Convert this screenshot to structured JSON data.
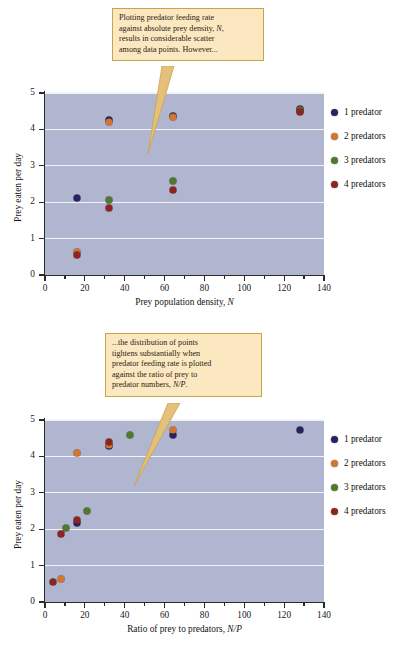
{
  "colors": {
    "plot_background": "#b0b6cf",
    "gridline": "#f2f3f8",
    "callout_fill": "#fbe8c0",
    "callout_border": "#c8a44e",
    "series_1_predator": "#2b2060",
    "series_2_predators": "#d4762a",
    "series_3_predators": "#4f7a2a",
    "series_4_predators": "#8e2420"
  },
  "legend": {
    "items": [
      {
        "label": "1 predator",
        "color": "#2b2060"
      },
      {
        "label": "2 predators",
        "color": "#d4762a"
      },
      {
        "label": "3 predators",
        "color": "#4f7a2a"
      },
      {
        "label": "4 predators",
        "color": "#8e2420"
      }
    ]
  },
  "callouts": {
    "top": {
      "lines": [
        "Plotting predator feeding rate",
        "against absolute prey density, N,",
        "results in considerable scatter",
        "among data points. However..."
      ]
    },
    "bottom": {
      "lines": [
        "...the distribution of points",
        "tightens substantially when",
        "predator feeding rate is plotted",
        "against the ratio of prey to",
        "predator numbers, N/P."
      ]
    }
  },
  "axis_ticks": {
    "y": [
      "0",
      "1",
      "2",
      "3",
      "4",
      "5"
    ],
    "x": [
      "0",
      "20",
      "40",
      "60",
      "80",
      "100",
      "120",
      "140"
    ]
  },
  "chart_data": [
    {
      "id": "top",
      "type": "scatter",
      "title": "",
      "xlabel": "Prey population density, N",
      "ylabel": "Prey eaten per day",
      "xlim": [
        0,
        140
      ],
      "ylim": [
        0,
        5
      ],
      "xticks": [
        0,
        20,
        40,
        60,
        80,
        100,
        120,
        140
      ],
      "yticks": [
        0,
        1,
        2,
        3,
        4,
        5
      ],
      "grid": true,
      "legend_position": "right",
      "series": [
        {
          "name": "1 predator",
          "color": "#2b2060",
          "points": [
            [
              16,
              2.12
            ],
            [
              32,
              4.25
            ],
            [
              64,
              4.37
            ],
            [
              128,
              4.55
            ]
          ]
        },
        {
          "name": "2 predators",
          "color": "#d4762a",
          "points": [
            [
              16,
              0.62
            ],
            [
              32,
              4.21
            ],
            [
              64,
              4.33
            ],
            [
              128,
              4.52
            ]
          ]
        },
        {
          "name": "3 predators",
          "color": "#4f7a2a",
          "points": [
            [
              32,
              2.07
            ],
            [
              64,
              2.57
            ],
            [
              128,
              4.5
            ]
          ]
        },
        {
          "name": "4 predators",
          "color": "#8e2420",
          "points": [
            [
              16,
              0.54
            ],
            [
              32,
              1.84
            ],
            [
              64,
              2.34
            ],
            [
              128,
              4.48
            ]
          ]
        }
      ]
    },
    {
      "id": "bottom",
      "type": "scatter",
      "title": "",
      "xlabel": "Ratio of prey to predators, N/P",
      "ylabel": "Prey eaten per day",
      "xlim": [
        0,
        140
      ],
      "ylim": [
        0,
        5
      ],
      "xticks": [
        0,
        20,
        40,
        60,
        80,
        100,
        120,
        140
      ],
      "yticks": [
        0,
        1,
        2,
        3,
        4,
        5
      ],
      "grid": true,
      "legend_position": "right",
      "series": [
        {
          "name": "1 predator",
          "color": "#2b2060",
          "points": [
            [
              16,
              2.18
            ],
            [
              32,
              4.28
            ],
            [
              64,
              4.58
            ],
            [
              128,
              4.73
            ]
          ]
        },
        {
          "name": "2 predators",
          "color": "#d4762a",
          "points": [
            [
              8,
              0.62
            ],
            [
              16,
              4.1
            ],
            [
              32,
              4.3
            ],
            [
              64,
              4.72
            ]
          ]
        },
        {
          "name": "3 predators",
          "color": "#4f7a2a",
          "points": [
            [
              10.7,
              2.03
            ],
            [
              21.3,
              2.51
            ],
            [
              42.7,
              4.59
            ]
          ]
        },
        {
          "name": "4 predators",
          "color": "#8e2420",
          "points": [
            [
              4,
              0.56
            ],
            [
              8,
              1.86
            ],
            [
              16,
              2.25
            ],
            [
              32,
              4.4
            ]
          ]
        }
      ]
    }
  ]
}
